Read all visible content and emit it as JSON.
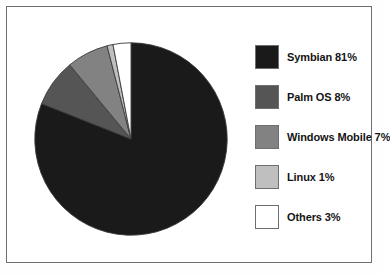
{
  "chart_data": {
    "type": "pie",
    "title": "",
    "subtitle": "",
    "xlabel": "",
    "ylabel": "",
    "legend_position": "right",
    "grid": false,
    "start_angle_deg": 0,
    "direction": "clockwise",
    "categories": [
      "Symbian",
      "Palm OS",
      "Windows Mobile",
      "Linux",
      "Others"
    ],
    "values": [
      81,
      8,
      7,
      1,
      3
    ],
    "unit": "%",
    "slices": [
      {
        "label": "Symbian",
        "value": 81,
        "legend_text": "Symbian 81%",
        "color": "#1a1a1a",
        "start_deg": 0,
        "end_deg": 291.6
      },
      {
        "label": "Palm OS",
        "value": 8,
        "legend_text": "Palm OS 8%",
        "color": "#555555",
        "start_deg": 291.6,
        "end_deg": 320.4
      },
      {
        "label": "Windows Mobile",
        "value": 7,
        "legend_text": "Windows Mobile 7%",
        "color": "#828282",
        "start_deg": 320.4,
        "end_deg": 345.6
      },
      {
        "label": "Linux",
        "value": 1,
        "legend_text": "Linux 1%",
        "color": "#bfbfbf",
        "start_deg": 345.6,
        "end_deg": 349.2
      },
      {
        "label": "Others",
        "value": 3,
        "legend_text": "Others 3%",
        "color": "#ffffff",
        "start_deg": 349.2,
        "end_deg": 360
      }
    ]
  },
  "legend": {
    "items": [
      {
        "text": "Symbian 81%",
        "color": "#1a1a1a"
      },
      {
        "text": "Palm OS 8%",
        "color": "#555555"
      },
      {
        "text": "Windows Mobile 7%",
        "color": "#828282"
      },
      {
        "text": "Linux 1%",
        "color": "#bfbfbf"
      },
      {
        "text": "Others 3%",
        "color": "#ffffff"
      }
    ]
  },
  "style": {
    "frame_border_color": "#6f6f72",
    "background": "#ffffff",
    "slice_outline_color": "#3a3a3a"
  }
}
